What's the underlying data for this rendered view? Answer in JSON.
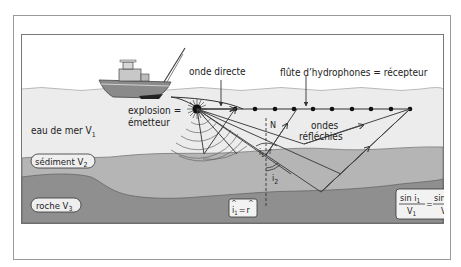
{
  "labels": {
    "onde_directe": "onde directe",
    "flute": "flûte d’hydrophones = récepteur",
    "explosion": "explosion =",
    "emetteur": "émetteur",
    "eau_de_mer": "eau de mer V",
    "eau_de_mer_sub": "1",
    "sediment": "sédiment V",
    "sediment_sub": "2",
    "roche": "roche V",
    "roche_sub": "3",
    "ondes": "ondes",
    "reflechies": "réfléchies",
    "normal": "N",
    "angle_i1": "i",
    "angle_i1_sub": "1",
    "angle_r": "r",
    "angle_i2": "i",
    "angle_i2_sub": "2"
  },
  "formulas": {
    "reflection_law": {
      "left": "i",
      "left_sub": "1",
      "eq": "=",
      "right": "r"
    },
    "snell_law": {
      "num_left": "sin i",
      "num_left_sub": "1",
      "den_left": "V",
      "den_left_sub": "1",
      "eq": "=",
      "num_right": "sin i",
      "num_right_sub": "2",
      "den_right": "V",
      "den_right_sub": "2"
    }
  },
  "colors": {
    "water": "#ededed",
    "sediment": "#b4b4b4",
    "rock": "#8e8e8e",
    "boat_hull": "#8a8a8a",
    "line": "#3a3a3a"
  }
}
